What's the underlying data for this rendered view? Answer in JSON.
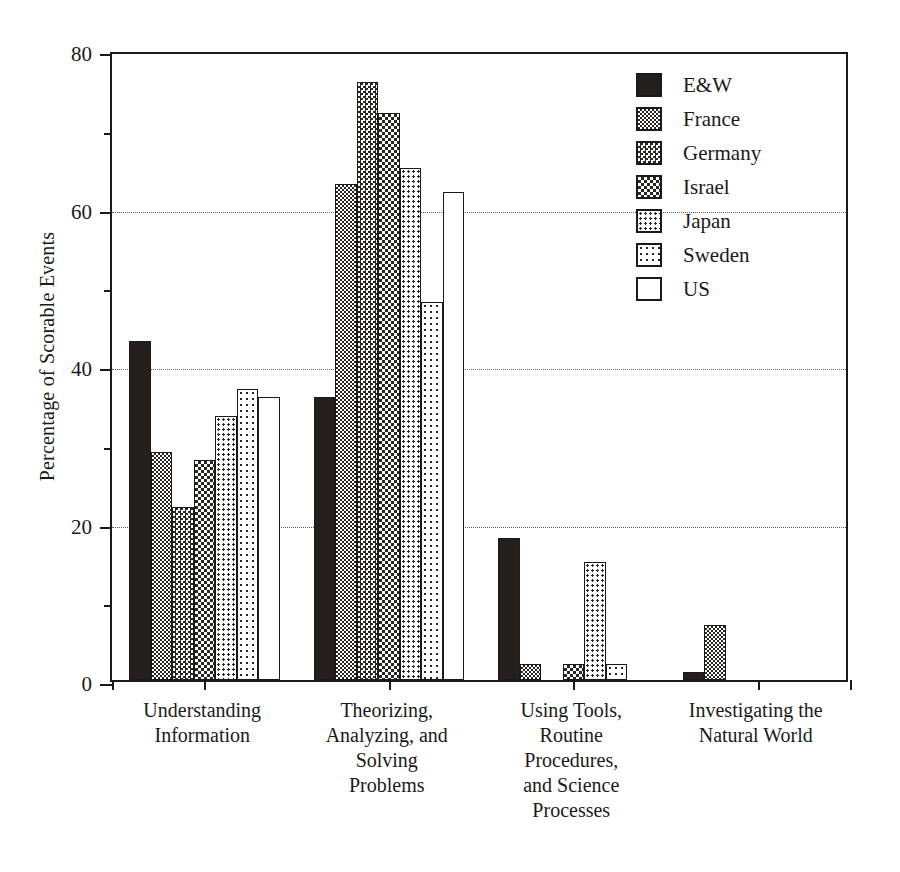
{
  "chart_data": {
    "type": "bar",
    "title": "",
    "xlabel": "",
    "ylabel": "Percentage of Scorable Events",
    "ylim": [
      0,
      80
    ],
    "yticks": [
      0,
      20,
      40,
      60,
      80
    ],
    "yticks_minor": [
      10,
      30,
      50,
      70
    ],
    "gridlines_at": [
      20,
      40,
      60
    ],
    "grid": true,
    "legend_position": "top-right",
    "categories": [
      "Understanding Information",
      "Theorizing, Analyzing, and Solving Problems",
      "Using Tools, Routine Procedures, and Science Processes",
      "Investigating the Natural World"
    ],
    "category_label_lines": [
      [
        "Understanding",
        "Information"
      ],
      [
        "Theorizing,",
        "Analyzing, and",
        "Solving",
        "Problems"
      ],
      [
        "Using Tools,",
        "Routine",
        "Procedures,",
        "and Science",
        "Processes"
      ],
      [
        "Investigating the",
        "Natural World"
      ]
    ],
    "series": [
      {
        "name": "E&W",
        "pattern": "solid-black",
        "values": [
          43,
          36,
          18,
          1
        ]
      },
      {
        "name": "France",
        "pattern": "dense-checker",
        "values": [
          29,
          63,
          2,
          7
        ]
      },
      {
        "name": "Germany",
        "pattern": "checker",
        "values": [
          22,
          76,
          0,
          0
        ]
      },
      {
        "name": "Israel",
        "pattern": "light-checker",
        "values": [
          28,
          72,
          2,
          0
        ]
      },
      {
        "name": "Japan",
        "pattern": "dots",
        "values": [
          33.5,
          65,
          15,
          0
        ]
      },
      {
        "name": "Sweden",
        "pattern": "sparse-dots",
        "values": [
          37,
          48,
          2,
          0
        ]
      },
      {
        "name": "US",
        "pattern": "white",
        "values": [
          36,
          62,
          0,
          0
        ]
      }
    ]
  },
  "legend": {
    "items": [
      {
        "label": "E&W"
      },
      {
        "label": "France"
      },
      {
        "label": "Germany"
      },
      {
        "label": "Israel"
      },
      {
        "label": "Japan"
      },
      {
        "label": "Sweden"
      },
      {
        "label": "US"
      }
    ]
  },
  "axis": {
    "y_title": "Percentage of Scorable Events",
    "y_tick_labels": [
      "80",
      "60",
      "40",
      "20",
      "0"
    ]
  },
  "colors": {
    "ink": "#1a1a1a",
    "fill_dark": "#241f1c",
    "paper": "#ffffff",
    "grid": "#5a5a5a"
  }
}
